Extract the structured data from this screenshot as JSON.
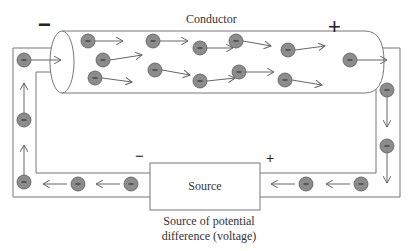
{
  "diagram": {
    "title": "Conductor",
    "source_label": "Source",
    "caption_line1": "Source of potential",
    "caption_line2": "difference (voltage)",
    "conductor_negative_sign": "−",
    "conductor_positive_sign": "+",
    "source_negative_sign": "−",
    "source_positive_sign": "+",
    "electron_symbol": "−",
    "colors": {
      "electron_fill": "#8c8c8c",
      "electron_stroke": "#5a5a5a",
      "line": "#777777",
      "arrow": "#666666",
      "text": "#333333"
    },
    "conductor_electrons": [
      {
        "x": 88,
        "y": 41,
        "dx": 28,
        "dy": 0
      },
      {
        "x": 103,
        "y": 60,
        "dx": 32,
        "dy": -5
      },
      {
        "x": 95,
        "y": 78,
        "dx": 30,
        "dy": 4
      },
      {
        "x": 153,
        "y": 41,
        "dx": 28,
        "dy": 0
      },
      {
        "x": 155,
        "y": 70,
        "dx": 28,
        "dy": 5
      },
      {
        "x": 200,
        "y": 48,
        "dx": 26,
        "dy": 0
      },
      {
        "x": 200,
        "y": 81,
        "dx": 28,
        "dy": -3
      },
      {
        "x": 236,
        "y": 41,
        "dx": 28,
        "dy": 5
      },
      {
        "x": 239,
        "y": 72,
        "dx": 28,
        "dy": 0
      },
      {
        "x": 288,
        "y": 50,
        "dx": 30,
        "dy": -4
      },
      {
        "x": 285,
        "y": 80,
        "dx": 30,
        "dy": 5
      }
    ],
    "wire_electrons": [
      {
        "x": 24,
        "y": 60,
        "dir": "right"
      },
      {
        "x": 24,
        "y": 120,
        "dir": "up"
      },
      {
        "x": 24,
        "y": 182,
        "dir": "up"
      },
      {
        "x": 78,
        "y": 184,
        "dir": "left"
      },
      {
        "x": 131,
        "y": 184,
        "dir": "left"
      },
      {
        "x": 306,
        "y": 184,
        "dir": "left"
      },
      {
        "x": 361,
        "y": 184,
        "dir": "left"
      },
      {
        "x": 350,
        "y": 60,
        "dir": "right"
      },
      {
        "x": 387,
        "y": 90,
        "dir": "down"
      },
      {
        "x": 387,
        "y": 146,
        "dir": "down"
      }
    ]
  }
}
